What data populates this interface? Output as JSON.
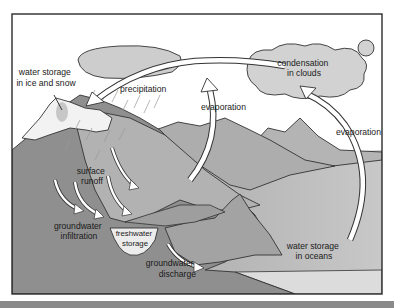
{
  "diagram": {
    "labels": {
      "ice_snow_line1": "water storage",
      "ice_snow_line2": "in ice and snow",
      "precipitation": "precipitation",
      "condensation_line1": "condensation",
      "condensation_line2": "in clouds",
      "evaporation_land": "evaporation",
      "evaporation_ocean": "evaporation",
      "surface_runoff_line1": "surface",
      "surface_runoff_line2": "runoff",
      "infiltration_line1": "groundwater",
      "infiltration_line2": "infiltration",
      "freshwater_line1": "freshwater",
      "freshwater_line2": "storage",
      "discharge_line1": "groundwater",
      "discharge_line2": "discharge",
      "ocean_line1": "water storage",
      "ocean_line2": "in oceans"
    },
    "colors": {
      "sky": "#ffffff",
      "frame": "#2b2b2b",
      "land_dark": "#8e8e8e",
      "land_mid": "#a9a9a9",
      "land_light": "#bdbdbd",
      "snow": "#f4f4f4",
      "cloud": "#cfcfcf",
      "ocean": "#b8b8b8",
      "arrow_fill": "#ffffff",
      "bottom_bar": "#8a8a8a"
    }
  }
}
